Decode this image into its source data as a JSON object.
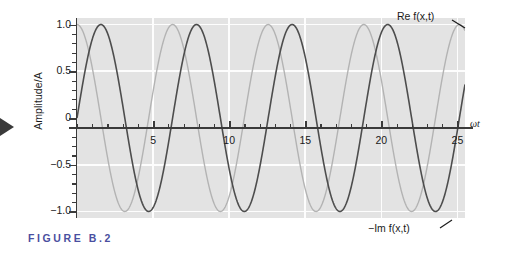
{
  "figure": {
    "caption": "FIGURE  B.2",
    "caption_color": "#4a4fa0"
  },
  "annotations": {
    "re_label": "Re f(x,t)",
    "im_label": "−Im f(x,t)"
  },
  "axes": {
    "y_title": "Amplitude/A",
    "x_title": "ωt",
    "y_ticks": [
      "1.0",
      "0.5",
      "0",
      "−0.5",
      "−1.0"
    ],
    "y_tick_values": [
      1.0,
      0.5,
      0,
      -0.5,
      -1.0
    ],
    "x_ticks": [
      "5",
      "10",
      "15",
      "20",
      "25"
    ],
    "x_tick_values": [
      5,
      10,
      15,
      20,
      25
    ]
  },
  "chart_data": {
    "type": "line",
    "title": "FIGURE B.2",
    "xlabel": "ωt",
    "ylabel": "Amplitude/A",
    "xlim": [
      0,
      25.5
    ],
    "ylim": [
      -1.07,
      1.07
    ],
    "grid": true,
    "legend": "inline-annotations",
    "x_tick_labels": [
      "5",
      "10",
      "15",
      "20",
      "25"
    ],
    "y_tick_labels": [
      "1.0",
      "0.5",
      "0",
      "−0.5",
      "−1.0"
    ],
    "x_minor_tick_step": 1,
    "y_minor_tick_step": 0.1,
    "series": [
      {
        "name": "Re f(x,t)",
        "color": "#b3b3b3",
        "formula": "cos(ωt)",
        "amplitude": 1.0,
        "phase": 0,
        "period": 6.2832,
        "linewidth": 1.4,
        "x": [
          0,
          1.5708,
          3.1416,
          4.7124,
          6.2832,
          7.854,
          9.4248,
          10.9956,
          12.5664,
          14.1372,
          15.708,
          17.2788,
          18.8496,
          20.4204,
          21.9911,
          23.5619,
          25.1327
        ],
        "values": [
          1,
          0,
          -1,
          0,
          1,
          0,
          -1,
          0,
          1,
          0,
          -1,
          0,
          1,
          0,
          -1,
          0,
          1
        ]
      },
      {
        "name": "−Im f(x,t)",
        "color": "#4d4d4d",
        "formula": "sin(ωt)",
        "amplitude": 1.0,
        "phase": -1.5708,
        "period": 6.2832,
        "linewidth": 1.6,
        "x": [
          0,
          1.5708,
          3.1416,
          4.7124,
          6.2832,
          7.854,
          9.4248,
          10.9956,
          12.5664,
          14.1372,
          15.708,
          17.2788,
          18.8496,
          20.4204,
          21.9911,
          23.5619,
          25.1327
        ],
        "values": [
          0,
          1,
          0,
          -1,
          0,
          1,
          0,
          -1,
          0,
          1,
          0,
          -1,
          0,
          1,
          0,
          -1,
          0
        ]
      }
    ]
  }
}
